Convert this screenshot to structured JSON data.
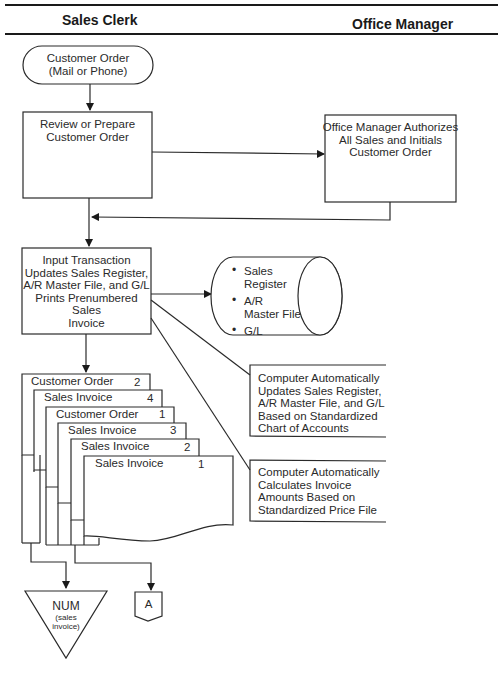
{
  "lanes": {
    "left": "Sales Clerk",
    "right": "Office Manager"
  },
  "nodes": {
    "start": {
      "line1": "Customer Order",
      "line2": "(Mail or Phone)"
    },
    "review": {
      "line1": "Review or Prepare",
      "line2": "Customer Order"
    },
    "authorize": {
      "line1": "Office Manager Authorizes",
      "line2": "All Sales and Initials",
      "line3": "Customer Order"
    },
    "input": {
      "line1": "Input Transaction",
      "line2": "Updates Sales Register,",
      "line3": "A/R Master File, and G/L",
      "line4": "Prints Prenumbered Sales",
      "line5": "Invoice"
    },
    "database": {
      "items": [
        "Sales Register",
        "A/R Master File",
        "G/L"
      ],
      "item0_l1": "Sales",
      "item0_l2": "Register",
      "item1_l1": "A/R",
      "item1_l2": "Master File",
      "item2_l1": "G/L"
    },
    "annotation1": {
      "line1": "Computer Automatically",
      "line2": "Updates Sales Register,",
      "line3": "A/R Master File, and G/L",
      "line4": "Based on Standardized",
      "line5": "Chart of Accounts"
    },
    "annotation2": {
      "line1": "Computer Automatically",
      "line2": "Calculates Invoice",
      "line3": "Amounts Based on",
      "line4": "Standardized Price File"
    },
    "documents": [
      {
        "label": "Customer Order",
        "copy": "2"
      },
      {
        "label": "Sales Invoice",
        "copy": "4"
      },
      {
        "label": "Customer Order",
        "copy": "1"
      },
      {
        "label": "Sales Invoice",
        "copy": "3"
      },
      {
        "label": "Sales Invoice",
        "copy": "2"
      },
      {
        "label": "Sales Invoice",
        "copy": "1"
      }
    ],
    "file": {
      "label": "NUM",
      "sub1": "(sales",
      "sub2": "invoice)"
    },
    "connector": {
      "label": "A"
    }
  }
}
